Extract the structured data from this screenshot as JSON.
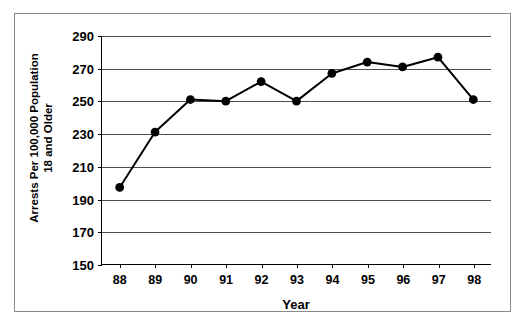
{
  "chart_data": {
    "type": "line",
    "title": "",
    "xlabel": "Year",
    "ylabel": "Arrests Per 100,000 Population 18 and Older",
    "ylabel_lines": [
      "Arrests Per 100,000 Population",
      "18 and Older"
    ],
    "categories": [
      "88",
      "89",
      "90",
      "91",
      "92",
      "93",
      "94",
      "95",
      "96",
      "97",
      "98"
    ],
    "values": [
      197,
      231,
      251,
      250,
      262,
      250,
      267,
      274,
      271,
      277,
      251
    ],
    "series": [
      {
        "name": "Arrests Per 100,000 Population 18 and Older",
        "values": [
          197,
          231,
          251,
          250,
          262,
          250,
          267,
          274,
          271,
          277,
          251
        ]
      }
    ],
    "ylim": [
      150,
      290
    ],
    "yticks": [
      150,
      170,
      190,
      210,
      230,
      250,
      270,
      290
    ],
    "ytick_labels": [
      "150",
      "170",
      "190",
      "210",
      "230",
      "250",
      "270",
      "290"
    ],
    "xtick_labels": [
      "88",
      "89",
      "90",
      "91",
      "92",
      "93",
      "94",
      "95",
      "96",
      "97",
      "98"
    ],
    "grid": true,
    "grid_axis": "y",
    "legend": false,
    "legend_position": "none",
    "marker": "filled-circle",
    "line_color": "#000000",
    "marker_color": "#000000",
    "grid_color": "#4d4d4d",
    "axis_color": "#000000",
    "background_color": "#ffffff",
    "border_color": "#8a8a8a"
  }
}
